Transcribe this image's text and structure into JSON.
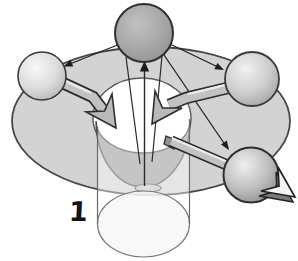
{
  "figure": {
    "type": "diagram",
    "label": "1",
    "background": "#ffffff",
    "colors": {
      "outline": "#3c3c3c",
      "thin_arrow": "#232323",
      "torus_fill": "#d3d3d3",
      "hole_fill": "#ffffff",
      "bowl_fill": "#9c9c9c",
      "base_ellipse_fill": "#c4c4c4",
      "cylinder_body_fill": "rgba(255,255,255,0.42)",
      "cylinder_bottom_fill": "rgba(246,246,246,0.8)",
      "block_arrow_fill": "#c2c2c2",
      "block_arrow_dark": "#2d2d2d",
      "exit_arrow_fill": "#f4f4f4",
      "exit_arrow_side": "#7a7a7a",
      "sphere_top_fill": "#a6a6a6",
      "sphere_left_fill": "#dcdcdc",
      "sphere_right_fill": "#cdcdcd",
      "sphere_bottom_right_fill": "#bdbdbd"
    }
  }
}
